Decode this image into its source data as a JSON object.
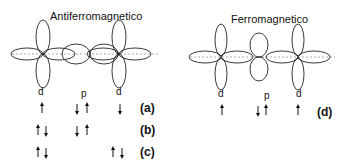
{
  "titles": {
    "antiferro": "Antiferromagnetico",
    "ferro": "Ferromagnetico"
  },
  "orbital_labels": {
    "d1": "d",
    "p": "p",
    "d2": "d",
    "fd1": "d",
    "fp": "p",
    "fd2": "d"
  },
  "cases": {
    "a": "(a)",
    "b": "(b)",
    "c": "(c)",
    "d": "(d)"
  }
}
